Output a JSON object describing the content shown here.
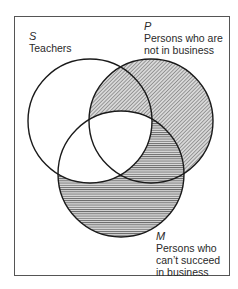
{
  "diagram": {
    "type": "venn",
    "sets": [
      {
        "id": "S",
        "letter": "S",
        "label": "Teachers",
        "cx": 90,
        "cy": 121,
        "r": 62
      },
      {
        "id": "P",
        "letter": "P",
        "label_lines": [
          "Persons who are",
          "not in business"
        ],
        "cx": 151,
        "cy": 121,
        "r": 62
      },
      {
        "id": "M",
        "letter": "M",
        "label_lines": [
          "Persons who",
          "can't succeed",
          "in business"
        ],
        "cx": 121,
        "cy": 174,
        "r": 63
      }
    ],
    "shading": {
      "diagonal": "P minus M",
      "horizontal": "M minus S"
    },
    "colors": {
      "stroke": "#1a1a1a",
      "frame": "#555555",
      "hatch": "#555555",
      "background": "#ffffff"
    }
  },
  "labels": {
    "S": {
      "letter": "S",
      "line1": "Teachers"
    },
    "P": {
      "letter": "P",
      "line1": "Persons who are",
      "line2": "not in business"
    },
    "M": {
      "letter": "M",
      "line1": "Persons who",
      "line2": "can’t succeed",
      "line3": "in business"
    }
  }
}
